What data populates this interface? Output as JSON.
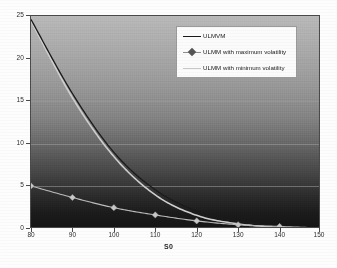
{
  "chart_data": {
    "type": "line",
    "title": "",
    "xlabel": "S0",
    "ylabel": "",
    "xlim": [
      80,
      150
    ],
    "ylim": [
      0,
      25
    ],
    "grid": true,
    "legend_position": "top-right",
    "x_ticks": [
      "80",
      "90",
      "100",
      "110",
      "120",
      "130",
      "140",
      "150"
    ],
    "y_ticks": [
      "0",
      "5",
      "10",
      "15",
      "20",
      "25"
    ],
    "x": [
      80,
      90,
      100,
      110,
      120,
      130,
      140,
      150
    ],
    "series": [
      {
        "name": "ULMVM",
        "style": "line",
        "color": "#1a1a1a",
        "values": [
          24.6,
          15.9,
          9.0,
          4.6,
          2.1,
          0.9,
          0.35,
          0.12
        ]
      },
      {
        "name": "ULMM with maximum volatility",
        "style": "line-markers",
        "marker": "diamond",
        "color": "#b8b8b8",
        "values": [
          5.05,
          3.7,
          2.5,
          1.65,
          0.95,
          0.5,
          0.3,
          0.12
        ]
      },
      {
        "name": "ULMM with minimum volatility",
        "style": "line",
        "color": "#cfcfcf",
        "values": [
          24.4,
          15.4,
          8.5,
          4.0,
          1.6,
          0.6,
          0.2,
          0.06
        ]
      }
    ]
  },
  "axis": {
    "x_title": "S0",
    "x_ticks": [
      "80",
      "90",
      "100",
      "110",
      "120",
      "130",
      "140",
      "150"
    ],
    "y_ticks": [
      "25",
      "20",
      "15",
      "10",
      "5",
      "0"
    ]
  },
  "legend": {
    "entries": [
      {
        "label": "ULMVM"
      },
      {
        "label": "ULMM with maximum volatility"
      },
      {
        "label": "ULMM with minimum volatility"
      }
    ]
  },
  "colors": {
    "series_dark": "#1a1a1a",
    "series_light": "#cfcfcf",
    "series_marker": "#b8b8b8",
    "frame": "#4a4a4a",
    "gridline": "#a0a0a0",
    "legend_bg": "#fbfbfb"
  }
}
